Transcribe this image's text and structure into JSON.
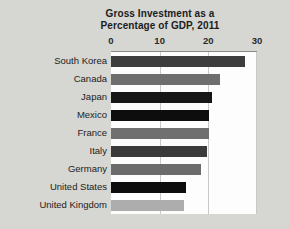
{
  "chart_data": {
    "type": "bar",
    "orientation": "horizontal",
    "title": "Gross Investment as a Percentage of GDP, 2011",
    "title_line1": "Gross Investment as a",
    "title_line2": "Percentage of GDP, 2011",
    "xlabel": "",
    "ylabel": "",
    "xlim": [
      0,
      30
    ],
    "ticks": [
      0,
      10,
      20,
      30
    ],
    "tick_labels": [
      "0",
      "10",
      "20",
      "30"
    ],
    "grid": true,
    "legend": "none",
    "categories": [
      "South Korea",
      "Canada",
      "Japan",
      "Mexico",
      "France",
      "Italy",
      "Germany",
      "United States",
      "United Kingdom"
    ],
    "values": [
      27.5,
      22.4,
      20.7,
      20.1,
      20.1,
      19.7,
      18.5,
      15.4,
      15.1
    ],
    "bar_colors": [
      "#3d3d3d",
      "#6e6e6e",
      "#171717",
      "#0d0d0d",
      "#707070",
      "#3a3a3a",
      "#6b6b6b",
      "#0d0d0d",
      "#adadad"
    ]
  },
  "colors": {
    "page_background": "#d6d6d2",
    "plot_background": "#fdfdfd",
    "gridline": "#c9c9c9",
    "axis": "#8a8a8a",
    "text": "#1c1c1c"
  }
}
